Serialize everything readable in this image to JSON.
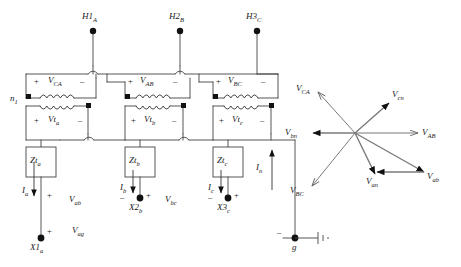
{
  "diagram": {
    "line_color": "#111111",
    "wire_color": "#555555",
    "phasor_color": "#666666"
  },
  "circuit": {
    "hv_terminals": [
      {
        "name": "h1",
        "label": "H1",
        "sub": "A"
      },
      {
        "name": "h2",
        "label": "H2",
        "sub": "B"
      },
      {
        "name": "h3",
        "label": "H3",
        "sub": "C"
      }
    ],
    "neutral_label": {
      "label": "n",
      "sub": "1"
    },
    "primary_windings": [
      {
        "name": "v-ca",
        "label": "V",
        "sub": "CA",
        "plus": "+",
        "minus": "–"
      },
      {
        "name": "v-ab",
        "label": "V",
        "sub": "AB",
        "plus": "+",
        "minus": "–"
      },
      {
        "name": "v-bc",
        "label": "V",
        "sub": "BC",
        "plus": "+",
        "minus": "–"
      }
    ],
    "secondary_windings": [
      {
        "name": "vt-a",
        "label": "Vt",
        "sub": "a",
        "plus": "+",
        "minus": "–"
      },
      {
        "name": "vt-b",
        "label": "Vt",
        "sub": "b",
        "plus": "+",
        "minus": "–"
      },
      {
        "name": "vt-c",
        "label": "Vt",
        "sub": "c",
        "plus": "+",
        "minus": "–"
      }
    ],
    "impedances": [
      {
        "name": "zt-a",
        "label": "Zt",
        "sub": "a"
      },
      {
        "name": "zt-b",
        "label": "Zt",
        "sub": "b"
      },
      {
        "name": "zt-c",
        "label": "Zt",
        "sub": "c"
      }
    ],
    "currents": [
      {
        "name": "i-a",
        "label": "I",
        "sub": "a",
        "direction": "down"
      },
      {
        "name": "i-b",
        "label": "I",
        "sub": "b",
        "direction": "down"
      },
      {
        "name": "i-c",
        "label": "I",
        "sub": "c",
        "direction": "down"
      },
      {
        "name": "i-n",
        "label": "I",
        "sub": "n",
        "direction": "up"
      }
    ],
    "lv_terminals": [
      {
        "name": "x1",
        "label": "X1",
        "sub": "a"
      },
      {
        "name": "x2",
        "label": "X2",
        "sub": "b"
      },
      {
        "name": "x3",
        "label": "X3",
        "sub": "c"
      }
    ],
    "output_voltages": [
      {
        "name": "v-ab-low",
        "label": "V",
        "sub": "ab"
      },
      {
        "name": "v-bc-low",
        "label": "V",
        "sub": "bc"
      },
      {
        "name": "v-ag-low",
        "label": "V",
        "sub": "ag"
      }
    ],
    "ground": {
      "name": "ground",
      "label": "g",
      "minus": "–"
    }
  },
  "phasor_diagram": {
    "vectors": [
      {
        "name": "v-ca-phasor",
        "label": "V",
        "sub": "CA",
        "angle_deg": 150,
        "style": "open"
      },
      {
        "name": "v-cn-phasor",
        "label": "V",
        "sub": "cn",
        "angle_deg": 45,
        "style": "solid"
      },
      {
        "name": "v-ab-phasor-hv",
        "label": "V",
        "sub": "AB",
        "angle_deg": 0,
        "style": "open"
      },
      {
        "name": "v-bn-phasor",
        "label": "V",
        "sub": "bn",
        "angle_deg": 180,
        "style": "solid"
      },
      {
        "name": "v-bc-phasor",
        "label": "V",
        "sub": "BC",
        "angle_deg": 240,
        "style": "open"
      },
      {
        "name": "v-an-phasor",
        "label": "V",
        "sub": "an",
        "angle_deg": 285,
        "style": "solid"
      },
      {
        "name": "v-ab-phasor-lv",
        "label": "V",
        "sub": "ab",
        "angle_deg": 322,
        "style": "solid"
      }
    ]
  }
}
